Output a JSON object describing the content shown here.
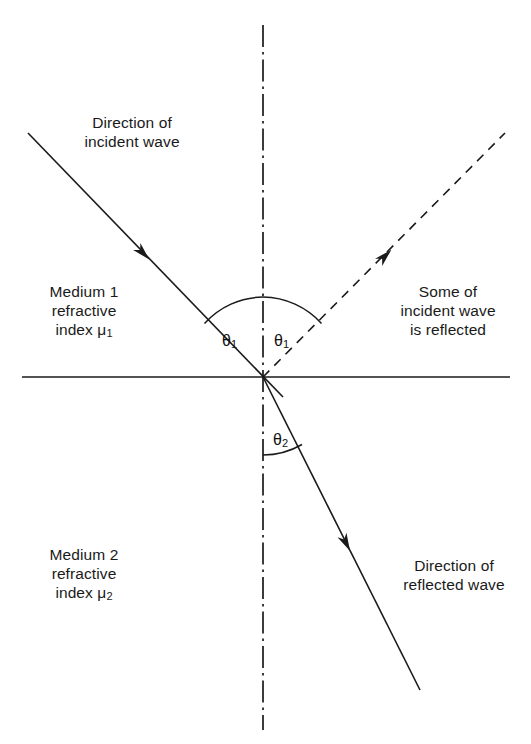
{
  "diagram": {
    "type": "optics-ray-diagram",
    "background_color": "#ffffff",
    "line_color": "#1a1a1a",
    "text_color": "#1a1a1a",
    "labels": {
      "incident_direction": {
        "line1": "Direction of",
        "line2": "incident wave"
      },
      "medium1": {
        "line1": "Medium 1",
        "line2": "refractive",
        "line3_prefix": "index ",
        "line3_symbol": "μ",
        "line3_subscript": "1"
      },
      "medium2": {
        "line1": "Medium 2",
        "line2": "refractive",
        "line3_prefix": "index ",
        "line3_symbol": "μ",
        "line3_subscript": "2"
      },
      "reflection_note": {
        "line1": "Some of",
        "line2": "incident wave",
        "line3": "is reflected"
      },
      "refracted_direction": {
        "line1": "Direction of",
        "line2": "reflected wave"
      }
    },
    "angles": {
      "incident": {
        "symbol": "θ",
        "subscript": "1"
      },
      "reflected": {
        "symbol": "θ",
        "subscript": "1"
      },
      "refracted": {
        "symbol": "θ",
        "subscript": "2"
      }
    },
    "geometry": {
      "origin_x": 263,
      "origin_y": 377,
      "normal_top_y": 25,
      "normal_bottom_y": 730,
      "interface_left_x": 22,
      "interface_right_x": 510,
      "incident_start_x": 28,
      "incident_start_y": 133,
      "incident_end_x": 283,
      "incident_end_y": 397,
      "reflected_end_x": 505,
      "reflected_end_y": 133,
      "refracted_end_x": 420,
      "refracted_end_y": 690,
      "incident_arrow_x": 143,
      "incident_arrow_y": 253,
      "reflected_arrow_x": 383,
      "reflected_arrow_y": 262,
      "refracted_arrow_x": 346,
      "refracted_arrow_y": 534,
      "theta1_arc_radius": 80,
      "theta2_arc_radius": 78
    }
  }
}
